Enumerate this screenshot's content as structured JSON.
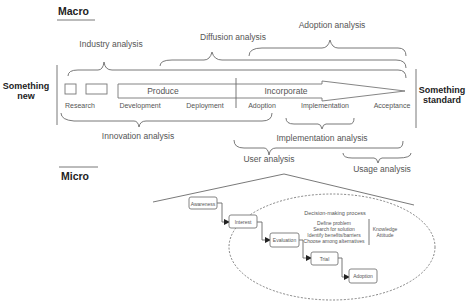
{
  "macro": {
    "heading": "Macro",
    "left_label": [
      "Something",
      "new"
    ],
    "right_label": [
      "Something",
      "standard"
    ],
    "arrow": {
      "produce": "Produce",
      "incorporate": "Incorporate"
    },
    "stages": [
      "Research",
      "Development",
      "Deployment",
      "Adoption",
      "Implementation",
      "Acceptance"
    ],
    "analyses_above": {
      "industry": "Industry analysis",
      "diffusion": "Diffusion analysis",
      "adoption": "Adoption analysis"
    },
    "analyses_below": {
      "innovation": "Innovation analysis",
      "implementation": "Implementation analysis",
      "user": "User analysis",
      "usage": "Usage analysis"
    }
  },
  "micro": {
    "heading": "Micro",
    "steps": [
      "Awareness",
      "Interest",
      "Evaluation",
      "Trial",
      "Adoption"
    ],
    "decision_process": {
      "title": "Decision-making process",
      "items": [
        "Define problem",
        "Search for solution",
        "Identify benefits/barriers",
        "Choose among alternatives"
      ],
      "factors": [
        "Knowledge",
        "Attitude"
      ]
    }
  }
}
